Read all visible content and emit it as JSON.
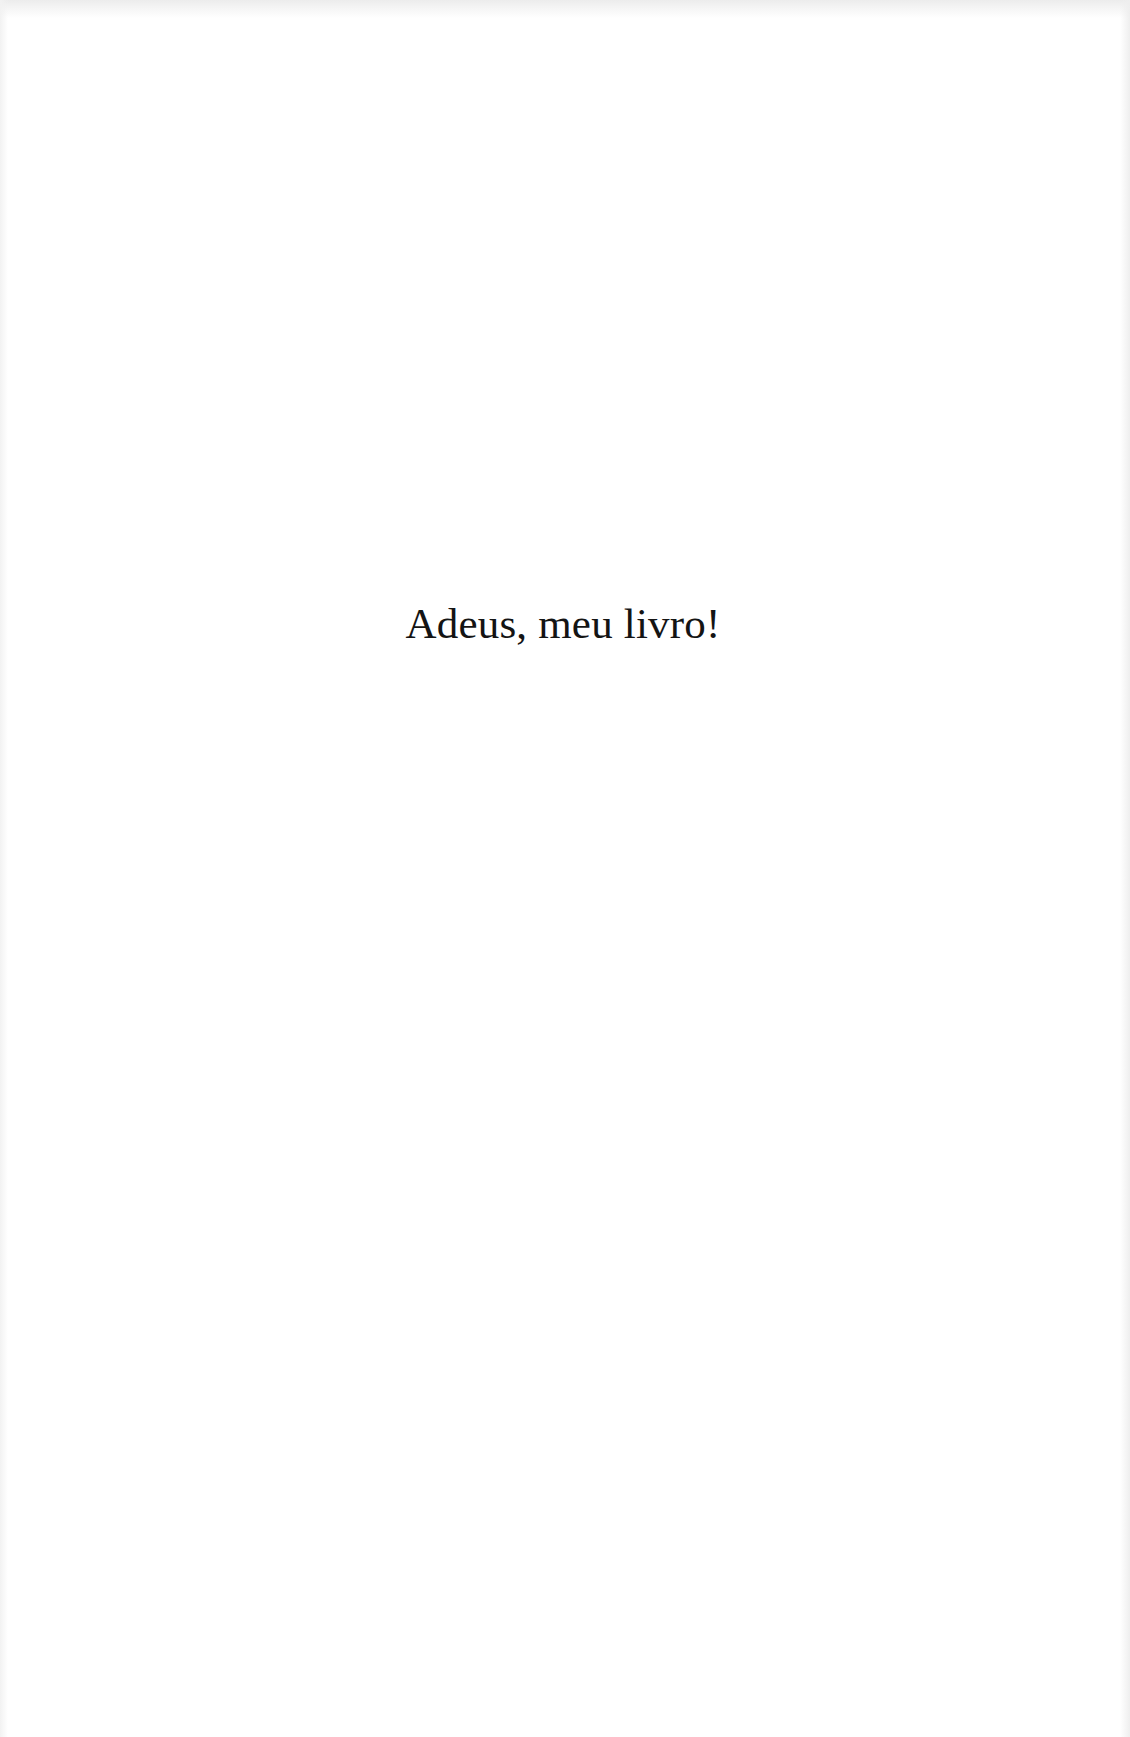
{
  "page": {
    "text": "Adeus, meu livro!",
    "background_color": "#ffffff",
    "text_color": "#141414"
  }
}
